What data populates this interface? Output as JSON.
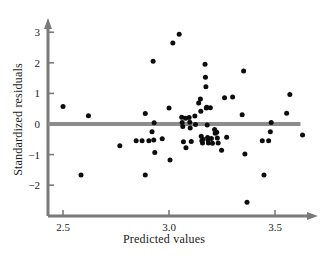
{
  "chart_data": {
    "type": "scatter",
    "title": "",
    "xlabel": "Predicted values",
    "ylabel": "Standardized residuals",
    "xlim": [
      2.43,
      3.72
    ],
    "ylim": [
      -2.85,
      3.35
    ],
    "xticks": [
      2.5,
      3.0,
      3.5
    ],
    "xtick_labels": [
      "2.5",
      "3.0",
      "3.5"
    ],
    "yticks": [
      -2,
      -1,
      0,
      1,
      2,
      3
    ],
    "ytick_labels": [
      "−2",
      "−1",
      "0",
      "1",
      "2",
      "3"
    ],
    "grid": false,
    "legend": null,
    "marker": {
      "shape": "circle",
      "color": "#0d0d0d",
      "size_px": 5.0
    },
    "reference_line": {
      "orientation": "horizontal",
      "y": 0,
      "x_start": 2.43,
      "x_end": 3.62,
      "color": "#8c8c8c",
      "width_px": 4
    },
    "axis_style": {
      "color": "#7a7a7a",
      "x_axis_arrow": true,
      "y_axis_arrow": true,
      "spine_left": true,
      "spine_bottom": true
    },
    "n_points": 72,
    "points": [
      {
        "x": 2.5,
        "y": 0.57
      },
      {
        "x": 2.585,
        "y": -1.67
      },
      {
        "x": 2.62,
        "y": 0.27
      },
      {
        "x": 2.768,
        "y": -0.71
      },
      {
        "x": 2.845,
        "y": -0.55
      },
      {
        "x": 2.873,
        "y": -0.55
      },
      {
        "x": 2.888,
        "y": 0.34
      },
      {
        "x": 2.888,
        "y": -1.67
      },
      {
        "x": 2.905,
        "y": -0.55
      },
      {
        "x": 2.92,
        "y": -0.25
      },
      {
        "x": 2.925,
        "y": 2.05
      },
      {
        "x": 2.928,
        "y": -0.52
      },
      {
        "x": 2.93,
        "y": 0.04
      },
      {
        "x": 2.933,
        "y": -0.93
      },
      {
        "x": 2.968,
        "y": -0.48
      },
      {
        "x": 3.0,
        "y": 0.52
      },
      {
        "x": 3.005,
        "y": -1.18
      },
      {
        "x": 3.018,
        "y": 2.65
      },
      {
        "x": 3.048,
        "y": 2.93
      },
      {
        "x": 3.06,
        "y": 0.22
      },
      {
        "x": 3.062,
        "y": 0.05
      },
      {
        "x": 3.065,
        "y": -0.08
      },
      {
        "x": 3.068,
        "y": -0.58
      },
      {
        "x": 3.078,
        "y": 0.19
      },
      {
        "x": 3.08,
        "y": -0.78
      },
      {
        "x": 3.095,
        "y": 0.21
      },
      {
        "x": 3.098,
        "y": 0.06
      },
      {
        "x": 3.1,
        "y": -0.13
      },
      {
        "x": 3.105,
        "y": -0.57
      },
      {
        "x": 3.122,
        "y": 0.26
      },
      {
        "x": 3.125,
        "y": -0.02
      },
      {
        "x": 3.14,
        "y": 0.69
      },
      {
        "x": 3.148,
        "y": 0.82
      },
      {
        "x": 3.15,
        "y": 0.42
      },
      {
        "x": 3.152,
        "y": -0.4
      },
      {
        "x": 3.155,
        "y": -0.55
      },
      {
        "x": 3.158,
        "y": -0.62
      },
      {
        "x": 3.16,
        "y": -0.5
      },
      {
        "x": 3.17,
        "y": 1.95
      },
      {
        "x": 3.172,
        "y": 1.53
      },
      {
        "x": 3.174,
        "y": 1.22
      },
      {
        "x": 3.176,
        "y": 0.52
      },
      {
        "x": 3.178,
        "y": 0.55
      },
      {
        "x": 3.18,
        "y": -0.03
      },
      {
        "x": 3.182,
        "y": -0.44
      },
      {
        "x": 3.184,
        "y": -0.52
      },
      {
        "x": 3.186,
        "y": -0.62
      },
      {
        "x": 3.195,
        "y": 0.53
      },
      {
        "x": 3.2,
        "y": -0.47
      },
      {
        "x": 3.205,
        "y": -0.63
      },
      {
        "x": 3.215,
        "y": -0.18
      },
      {
        "x": 3.218,
        "y": -0.3
      },
      {
        "x": 3.225,
        "y": -0.27
      },
      {
        "x": 3.228,
        "y": -0.46
      },
      {
        "x": 3.232,
        "y": -0.62
      },
      {
        "x": 3.248,
        "y": -0.86
      },
      {
        "x": 3.262,
        "y": 0.86
      },
      {
        "x": 3.272,
        "y": -0.43
      },
      {
        "x": 3.3,
        "y": 0.88
      },
      {
        "x": 3.345,
        "y": 0.3
      },
      {
        "x": 3.352,
        "y": 1.73
      },
      {
        "x": 3.358,
        "y": -0.98
      },
      {
        "x": 3.368,
        "y": -2.56
      },
      {
        "x": 3.44,
        "y": -0.55
      },
      {
        "x": 3.448,
        "y": -1.67
      },
      {
        "x": 3.47,
        "y": -0.55
      },
      {
        "x": 3.478,
        "y": -0.25
      },
      {
        "x": 3.482,
        "y": 0.05
      },
      {
        "x": 3.555,
        "y": 0.35
      },
      {
        "x": 3.57,
        "y": 0.96
      },
      {
        "x": 3.63,
        "y": -0.36
      }
    ]
  }
}
